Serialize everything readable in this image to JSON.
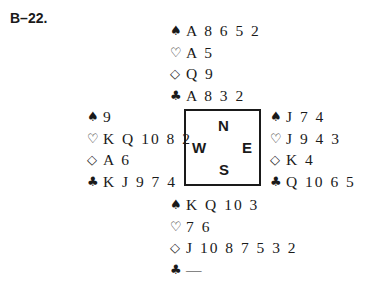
{
  "problem": {
    "title": "B–22."
  },
  "suits": {
    "spades": "♠",
    "hearts": "♡",
    "diamonds": "◇",
    "clubs": "♣"
  },
  "compass": {
    "north": "N",
    "west": "W",
    "east": "E",
    "south": "S"
  },
  "hands": {
    "north": {
      "spades": "A 8 6 5 2",
      "hearts": "A 5",
      "diamonds": "Q 9",
      "clubs": "A 8 3 2"
    },
    "west": {
      "spades": "9",
      "hearts": "K Q 10 8 2",
      "diamonds": "A 6",
      "clubs": "K J 9 7 4"
    },
    "east": {
      "spades": "J 7 4",
      "hearts": "J 9 4 3",
      "diamonds": "K 4",
      "clubs": "Q 10 6 5"
    },
    "south": {
      "spades": "K Q 10 3",
      "hearts": "7 6",
      "diamonds": "J 10 8 7 5 3 2",
      "clubs": "—"
    }
  }
}
